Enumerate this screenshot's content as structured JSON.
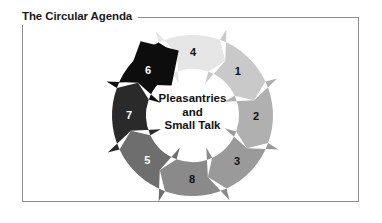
{
  "figure": {
    "title": "The Circular Agenda",
    "center_label": {
      "line1": "Pleasantries",
      "line2": "and",
      "line3": "Small Talk"
    },
    "frame_color": "#8d8f92",
    "background": "#ffffff"
  },
  "chart_data": {
    "type": "diagram",
    "subtype": "cycle-ring",
    "title": "The Circular Agenda",
    "center_text": "Pleasantries and Small Talk",
    "direction": "clockwise",
    "segment_count": 8,
    "arrowhead": {
      "position": "top-left",
      "color": "#0d0d0d",
      "points_to": "segment-4"
    },
    "segments": [
      {
        "label": "4",
        "order": 1,
        "angle_deg": 345,
        "color": "#e6e6e6",
        "label_color": "#111111",
        "label_x": 93,
        "label_y": 31
      },
      {
        "label": "1",
        "order": 2,
        "angle_deg": 30,
        "color": "#c9c9c9",
        "label_color": "#111111",
        "label_x": 144,
        "label_y": 48
      },
      {
        "label": "2",
        "order": 3,
        "angle_deg": 75,
        "color": "#b0b0b0",
        "label_color": "#111111",
        "label_x": 163,
        "label_y": 96
      },
      {
        "label": "3",
        "order": 4,
        "angle_deg": 120,
        "color": "#9a9a9a",
        "label_color": "#111111",
        "label_x": 141,
        "label_y": 141
      },
      {
        "label": "8",
        "order": 5,
        "angle_deg": 165,
        "color": "#8a8a8a",
        "label_color": "#111111",
        "label_x": 89,
        "label_y": 157
      },
      {
        "label": "5",
        "order": 6,
        "angle_deg": 210,
        "color": "#6e6e6e",
        "label_color": "#ffffff",
        "label_x": 40,
        "label_y": 138
      },
      {
        "label": "7",
        "order": 7,
        "angle_deg": 255,
        "color": "#2a2a2a",
        "label_color": "#ffffff",
        "label_x": 20,
        "label_y": 90
      },
      {
        "label": "6",
        "order": 8,
        "angle_deg": 300,
        "color": "#0d0d0d",
        "label_color": "#ffffff",
        "label_x": 42,
        "label_y": 43
      }
    ],
    "palette": [
      "#e6e6e6",
      "#c9c9c9",
      "#b0b0b0",
      "#9a9a9a",
      "#8a8a8a",
      "#6e6e6e",
      "#2a2a2a",
      "#0d0d0d"
    ]
  }
}
